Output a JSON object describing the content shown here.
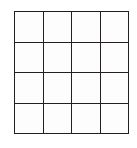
{
  "figure": {
    "name": "four-by-four-empty-grid",
    "type": "grid-diagram",
    "rows": 4,
    "columns": 4,
    "cell_count": 16,
    "line_color": "#231f20",
    "cell_fill": "#fdfdfd",
    "background": "#ffffff",
    "line_width_px": 2,
    "cells": [
      [
        "",
        "",
        "",
        ""
      ],
      [
        "",
        "",
        "",
        ""
      ],
      [
        "",
        "",
        "",
        ""
      ],
      [
        "",
        "",
        "",
        ""
      ]
    ]
  }
}
